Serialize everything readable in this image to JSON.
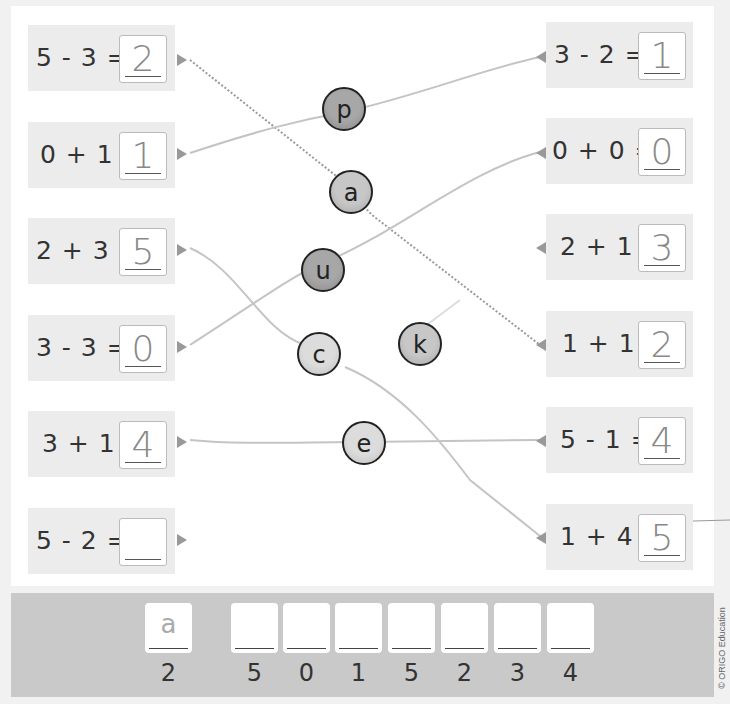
{
  "left_equations": [
    {
      "expr": "5 - 3 =",
      "answer": "2"
    },
    {
      "expr": "0 + 1 =",
      "answer": "1"
    },
    {
      "expr": "2 + 3 =",
      "answer": "5"
    },
    {
      "expr": "3 - 3 =",
      "answer": "0"
    },
    {
      "expr": "3 + 1 =",
      "answer": "4"
    },
    {
      "expr": "5 - 2 =",
      "answer": ""
    }
  ],
  "right_equations": [
    {
      "expr": "3 - 2 =",
      "answer": "1"
    },
    {
      "expr": "0 + 0 =",
      "answer": "0"
    },
    {
      "expr": "2 + 1 =",
      "answer": "3"
    },
    {
      "expr": "1 + 1 =",
      "answer": "2"
    },
    {
      "expr": "5 - 1 =",
      "answer": "4"
    },
    {
      "expr": "1 + 4 =",
      "answer": "5"
    }
  ],
  "letter_balls": [
    {
      "letter": "p"
    },
    {
      "letter": "a"
    },
    {
      "letter": "u"
    },
    {
      "letter": "c"
    },
    {
      "letter": "k"
    },
    {
      "letter": "e"
    }
  ],
  "decoder": {
    "slots": [
      {
        "letter": "a",
        "code": "2"
      },
      {
        "letter": "",
        "code": "5"
      },
      {
        "letter": "",
        "code": "0"
      },
      {
        "letter": "",
        "code": "1"
      },
      {
        "letter": "",
        "code": "5"
      },
      {
        "letter": "",
        "code": "2"
      },
      {
        "letter": "",
        "code": "3"
      },
      {
        "letter": "",
        "code": "4"
      }
    ]
  },
  "copyright": "© ORIGO Education"
}
